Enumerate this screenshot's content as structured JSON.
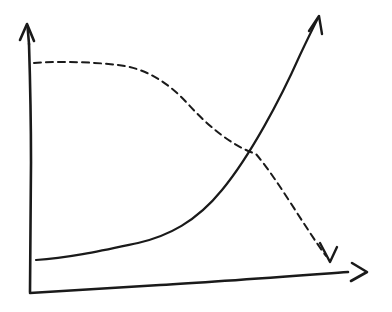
{
  "figure": {
    "title": "",
    "subtitle": "",
    "background_color": "#ffffff",
    "ink_color": "#1a1a1a",
    "style": "hand-drawn sketch",
    "width": 392,
    "height": 312
  },
  "axes": {
    "x_axis": {
      "name": "x-axis",
      "label": "",
      "tick_labels": [],
      "arrow": "right",
      "origin": [
        32,
        292
      ],
      "tip": [
        367,
        272
      ]
    },
    "y_axis": {
      "name": "y-axis",
      "label": "",
      "tick_labels": [],
      "arrow": "up",
      "origin": [
        31,
        292
      ],
      "tip": [
        27,
        24
      ]
    },
    "grid": false,
    "legend": "none"
  },
  "chart_data": {
    "type": "line",
    "title": "",
    "subtitle": "",
    "xlabel": "",
    "ylabel": "",
    "xlim": [
      0,
      1
    ],
    "ylim": [
      0,
      1
    ],
    "grid": false,
    "legend_position": "none",
    "annotations": [
      {
        "name": "crossover-point",
        "label": "",
        "x": 0.67,
        "y": 0.52
      }
    ],
    "series": [
      {
        "name": "rising-exponential",
        "label": "",
        "style": "solid",
        "stroke": "#1a1a1a",
        "stroke_width": 2.2,
        "arrow_end": "up-right",
        "x": [
          0.01,
          0.1,
          0.2,
          0.3,
          0.4,
          0.47,
          0.55,
          0.62,
          0.68,
          0.75,
          0.82,
          0.88,
          0.93,
          0.97
        ],
        "y": [
          0.12,
          0.13,
          0.15,
          0.17,
          0.2,
          0.23,
          0.28,
          0.35,
          0.44,
          0.56,
          0.68,
          0.8,
          0.9,
          0.98
        ],
        "path": "M 36 260 C 70 258 105 250 138 243 C 168 236 196 222 222 190 C 250 156 280 100 300 55 C 308 38 314 26 318 18"
      },
      {
        "name": "falling-sigmoid",
        "label": "",
        "style": "dashed",
        "stroke": "#1a1a1a",
        "stroke_width": 2.0,
        "dash_pattern": [
          7,
          5
        ],
        "arrow_end": "down-right",
        "x": [
          0.01,
          0.1,
          0.2,
          0.29,
          0.36,
          0.43,
          0.5,
          0.58,
          0.67,
          0.75,
          0.83,
          0.9,
          0.97
        ],
        "y": [
          0.86,
          0.86,
          0.86,
          0.84,
          0.8,
          0.74,
          0.66,
          0.59,
          0.52,
          0.41,
          0.3,
          0.19,
          0.11
        ],
        "path": "M 34 63 C 62 61 92 62 118 65 C 145 68 168 82 188 104 C 208 126 232 146 256 154 C 278 180 304 226 326 256"
      }
    ]
  }
}
